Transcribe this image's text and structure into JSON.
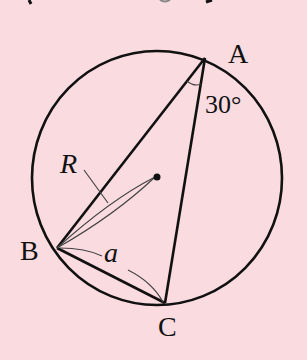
{
  "diagram": {
    "type": "inscribed-triangle-in-circle",
    "colors": {
      "background": "#f9dbe0",
      "stroke": "#111111",
      "thin_stroke": "#444444"
    },
    "circle": {
      "cx": 157,
      "cy": 178,
      "rx": 125,
      "ry": 127
    },
    "points": {
      "A": {
        "label": "A",
        "x": 205,
        "y": 58
      },
      "B": {
        "label": "B",
        "x": 57,
        "y": 248
      },
      "C": {
        "label": "C",
        "x": 165,
        "y": 303
      },
      "O": {
        "x": 157,
        "y": 177
      }
    },
    "labels": {
      "vertex_a": "A",
      "vertex_b": "B",
      "vertex_c": "C",
      "radius": "R",
      "side": "a",
      "angle_at_A": "30°"
    }
  }
}
